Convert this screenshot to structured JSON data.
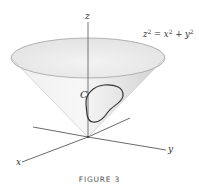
{
  "figure": {
    "caption": "FIGURE 3",
    "equation": {
      "lhs_var": "z",
      "lhs_exp": "2",
      "eq": " = ",
      "t1_var": "x",
      "t1_exp": "2",
      "plus": " + ",
      "t2_var": "y",
      "t2_exp": "2",
      "full_text": "z^2 = x^2 + y^2"
    },
    "axes": {
      "x_label": "x",
      "y_label": "y",
      "z_label": "z"
    },
    "curve_label": "C",
    "colors": {
      "cone_fill_light": "#f4f4f4",
      "cone_fill_dark": "#d9d9d9",
      "rim_stroke": "#9a9a9a",
      "axis_stroke": "#444444",
      "curve_stroke": "#333333",
      "background": "#ffffff"
    }
  }
}
